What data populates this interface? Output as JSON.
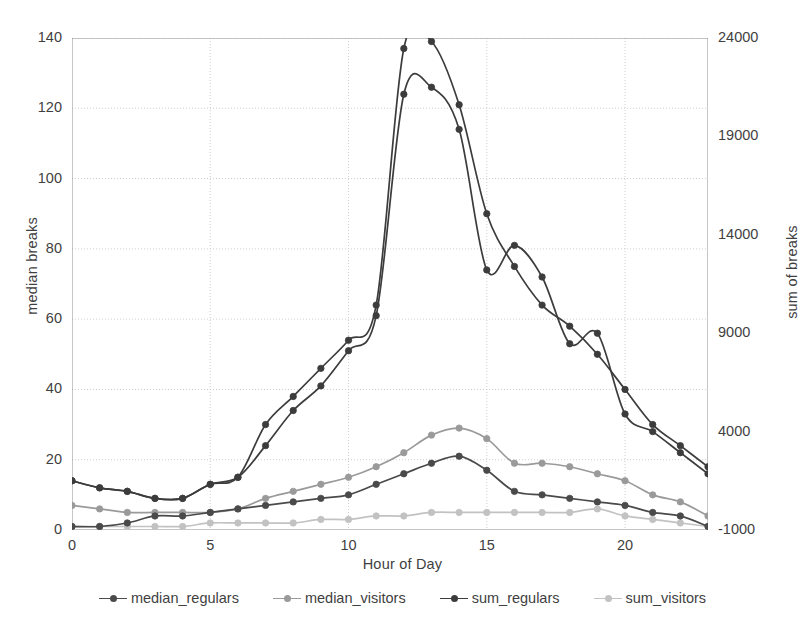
{
  "chart_data": {
    "type": "line",
    "title": "",
    "xlabel": "Hour of Day",
    "ylabel": "median breaks",
    "ylabel_right": "sum of breaks",
    "grid": true,
    "legend_position": "bottom",
    "x": [
      0,
      1,
      2,
      3,
      4,
      5,
      6,
      7,
      8,
      9,
      10,
      11,
      12,
      13,
      14,
      15,
      16,
      17,
      18,
      19,
      20,
      21,
      22,
      23
    ],
    "xlim": [
      0,
      23
    ],
    "xticks": [
      0,
      5,
      10,
      15,
      20
    ],
    "ylim": [
      0,
      140
    ],
    "yticks": [
      0,
      20,
      40,
      60,
      80,
      100,
      120,
      140
    ],
    "ylim_right": [
      -1000,
      24000
    ],
    "yticks_right": [
      -1000,
      4000,
      9000,
      14000,
      19000,
      24000
    ],
    "series": [
      {
        "name": "median_regulars",
        "axis": "left",
        "color": "#4a4a4a",
        "values": [
          1,
          1,
          2,
          4,
          4,
          5,
          6,
          7,
          8,
          9,
          10,
          13,
          16,
          19,
          21,
          17,
          11,
          10,
          9,
          8,
          7,
          5,
          4,
          1
        ]
      },
      {
        "name": "median_visitors",
        "axis": "left",
        "color": "#9a9a9a",
        "values": [
          7,
          6,
          5,
          5,
          5,
          5,
          6,
          9,
          11,
          13,
          15,
          18,
          22,
          27,
          29,
          26,
          19,
          19,
          18,
          16,
          14,
          10,
          8,
          4
        ]
      },
      {
        "name": "sum_regulars",
        "axis": "right",
        "color": "#3c3c3c",
        "values": [
          14,
          12,
          11,
          9,
          9,
          13,
          15,
          24,
          34,
          41,
          51,
          61,
          124,
          126,
          114,
          74,
          81,
          72,
          53,
          56,
          33,
          28,
          22,
          16
        ]
      },
      {
        "name": "sum_visitors",
        "axis": "right",
        "color": "#c2c2c2",
        "values": [
          1,
          1,
          1,
          1,
          1,
          2,
          2,
          2,
          2,
          3,
          3,
          4,
          4,
          5,
          5,
          5,
          5,
          5,
          5,
          6,
          4,
          3,
          2,
          1
        ]
      },
      {
        "name": "sum_regulars_upper",
        "axis": "right",
        "color": "#3c3c3c",
        "values": [
          14,
          12,
          11,
          9,
          9,
          13,
          15,
          30,
          38,
          46,
          54,
          64,
          137,
          139,
          121,
          90,
          75,
          64,
          58,
          50,
          40,
          30,
          24,
          18
        ]
      }
    ]
  },
  "axes": {
    "left_label": "median breaks",
    "right_label": "sum of breaks",
    "x_label": "Hour of Day",
    "left_ticks": [
      "140",
      "120",
      "100",
      "80",
      "60",
      "40",
      "20",
      "0"
    ],
    "right_ticks": [
      "24000",
      "19000",
      "14000",
      "9000",
      "4000",
      "-1000"
    ],
    "x_ticks": [
      "0",
      "5",
      "10",
      "15",
      "20"
    ]
  },
  "legend": {
    "items": [
      {
        "label": "median_regulars",
        "color": "#4a4a4a"
      },
      {
        "label": "median_visitors",
        "color": "#9a9a9a"
      },
      {
        "label": "sum_regulars",
        "color": "#3c3c3c"
      },
      {
        "label": "sum_visitors",
        "color": "#c2c2c2"
      }
    ]
  },
  "style": {
    "grid_color": "#c9c9c9",
    "axis_color": "#8d8d8d",
    "text_color": "#3f3f3f",
    "background": "#ffffff"
  }
}
